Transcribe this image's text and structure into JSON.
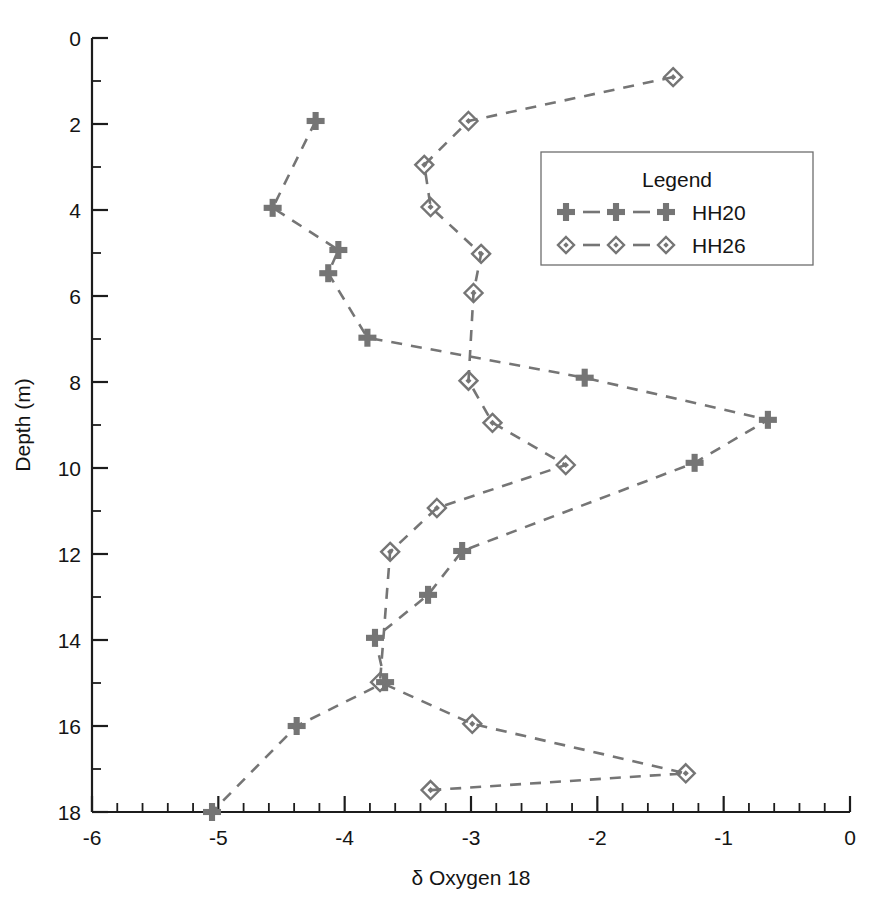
{
  "chart_data": {
    "type": "line",
    "title": "",
    "xlabel": "δ Oxygen 18",
    "ylabel": "Depth (m)",
    "xlim": [
      -6,
      0
    ],
    "ylim": [
      0,
      18
    ],
    "y_inverted": true,
    "grid": false,
    "x_ticks": [
      -6,
      -5,
      -4,
      -3,
      -2,
      -1,
      0
    ],
    "x_tick_labels": [
      "-6",
      "-5",
      "-4",
      "-3",
      "-2",
      "-1",
      "0"
    ],
    "x_minor_tick_interval": 0.2,
    "y_ticks": [
      0,
      2,
      4,
      6,
      8,
      10,
      12,
      14,
      16,
      18
    ],
    "y_tick_labels": [
      "0",
      "2",
      "4",
      "6",
      "8",
      "10",
      "12",
      "14",
      "16",
      "18"
    ],
    "y_minor_tick_interval": 1,
    "legend_title": "Legend",
    "legend_position": "upper-right-inset",
    "line_style": "dashed",
    "series_color": "#757575",
    "series": [
      {
        "name": "HH20",
        "marker": "plus",
        "points": [
          {
            "x": -4.23,
            "y": 1.93
          },
          {
            "x": -4.57,
            "y": 3.95
          },
          {
            "x": -4.05,
            "y": 4.93
          },
          {
            "x": -4.13,
            "y": 5.47
          },
          {
            "x": -3.82,
            "y": 6.97
          },
          {
            "x": -2.1,
            "y": 7.9
          },
          {
            "x": -0.65,
            "y": 8.88
          },
          {
            "x": -1.23,
            "y": 9.88
          },
          {
            "x": -3.07,
            "y": 11.93
          },
          {
            "x": -3.34,
            "y": 12.95
          },
          {
            "x": -3.76,
            "y": 13.95
          },
          {
            "x": -3.68,
            "y": 14.98
          },
          {
            "x": -4.38,
            "y": 16.0
          },
          {
            "x": -5.05,
            "y": 18.0
          }
        ]
      },
      {
        "name": "HH26",
        "marker": "diamond",
        "points": [
          {
            "x": -1.4,
            "y": 0.91
          },
          {
            "x": -3.02,
            "y": 1.93
          },
          {
            "x": -3.37,
            "y": 2.95
          },
          {
            "x": -3.32,
            "y": 3.93
          },
          {
            "x": -2.92,
            "y": 5.02
          },
          {
            "x": -2.98,
            "y": 5.93
          },
          {
            "x": -3.02,
            "y": 7.97
          },
          {
            "x": -2.83,
            "y": 8.95
          },
          {
            "x": -2.25,
            "y": 9.93
          },
          {
            "x": -3.27,
            "y": 10.93
          },
          {
            "x": -3.64,
            "y": 11.95
          },
          {
            "x": -3.72,
            "y": 14.98
          },
          {
            "x": -2.99,
            "y": 15.95
          },
          {
            "x": -1.3,
            "y": 17.1
          },
          {
            "x": -3.32,
            "y": 17.49
          }
        ]
      }
    ]
  },
  "legend": {
    "title": "Legend",
    "entries": [
      {
        "label": "HH20",
        "marker": "plus-icon"
      },
      {
        "label": "HH26",
        "marker": "diamond-icon"
      }
    ]
  },
  "axes": {
    "x_title": "δ Oxygen 18",
    "y_title": "Depth (m)"
  }
}
